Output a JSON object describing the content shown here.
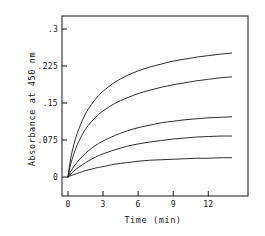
{
  "chart_data": {
    "type": "line",
    "title": "",
    "xlabel": "Time (min)",
    "ylabel": "Absorbance at 450 nm",
    "xlim": [
      0,
      14.2
    ],
    "ylim": [
      0,
      0.33
    ],
    "xticks": [
      0,
      3,
      6,
      9,
      12
    ],
    "xticklabels": [
      "0",
      "3",
      "6",
      "9",
      "12"
    ],
    "yticks": [
      0,
      0.075,
      0.15,
      0.225,
      0.3
    ],
    "yticklabels": [
      "0",
      ".075",
      ".15",
      ".225",
      ".3"
    ],
    "grid": false,
    "legend": false,
    "line_color": "#151515",
    "line_width": 0.9,
    "x": [
      0,
      0.15,
      0.3,
      0.5,
      0.75,
      1,
      1.5,
      2,
      2.5,
      3,
      4,
      5,
      6,
      7,
      8,
      9,
      10,
      11,
      12,
      13,
      14
    ],
    "series": [
      {
        "name": "curve-1",
        "values": [
          0,
          0.026,
          0.046,
          0.066,
          0.086,
          0.102,
          0.128,
          0.147,
          0.162,
          0.174,
          0.192,
          0.205,
          0.215,
          0.223,
          0.229,
          0.235,
          0.239,
          0.243,
          0.246,
          0.249,
          0.251
        ]
      },
      {
        "name": "curve-2",
        "values": [
          0,
          0.018,
          0.032,
          0.047,
          0.063,
          0.076,
          0.097,
          0.112,
          0.124,
          0.134,
          0.149,
          0.16,
          0.169,
          0.176,
          0.182,
          0.187,
          0.191,
          0.195,
          0.198,
          0.201,
          0.203
        ]
      },
      {
        "name": "curve-3",
        "values": [
          0,
          0.008,
          0.014,
          0.021,
          0.029,
          0.036,
          0.048,
          0.058,
          0.066,
          0.073,
          0.084,
          0.093,
          0.1,
          0.105,
          0.11,
          0.113,
          0.116,
          0.118,
          0.12,
          0.121,
          0.122
        ]
      },
      {
        "name": "curve-4",
        "values": [
          0,
          0.004,
          0.008,
          0.012,
          0.017,
          0.021,
          0.029,
          0.036,
          0.042,
          0.047,
          0.055,
          0.062,
          0.067,
          0.071,
          0.074,
          0.077,
          0.079,
          0.081,
          0.082,
          0.083,
          0.083
        ]
      },
      {
        "name": "curve-5",
        "values": [
          0,
          0.002,
          0.003,
          0.005,
          0.007,
          0.009,
          0.013,
          0.016,
          0.019,
          0.021,
          0.026,
          0.029,
          0.032,
          0.034,
          0.035,
          0.036,
          0.037,
          0.038,
          0.038,
          0.039,
          0.039
        ]
      }
    ]
  },
  "frame": {
    "left": 62,
    "right": 248,
    "top": 16,
    "bottom": 196
  }
}
